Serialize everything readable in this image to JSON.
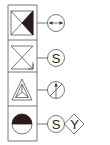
{
  "diagram": {
    "type": "symbol-legend",
    "colors": {
      "line": "#555555",
      "fill_dark": "#2a1a1a",
      "background": "#ffffff"
    },
    "rows": [
      {
        "index": 0,
        "left_symbol": "hourglass-box-right-triangle-filled",
        "connector": "horizontal-line",
        "right_symbols": [
          {
            "shape": "circle",
            "glyph": "double-arrow-horizontal",
            "label": ""
          }
        ]
      },
      {
        "index": 1,
        "left_symbol": "hourglass-box-with-arrow",
        "connector": "horizontal-line",
        "right_symbols": [
          {
            "shape": "circle",
            "glyph": "letter",
            "label": "S"
          }
        ]
      },
      {
        "index": 2,
        "left_symbol": "triangle-with-inner-y",
        "connector": "horizontal-line",
        "right_symbols": [
          {
            "shape": "circle",
            "glyph": "slash-with-up-arrow",
            "label": ""
          }
        ]
      },
      {
        "index": 3,
        "left_symbol": "circle-top-half-filled",
        "connector": "horizontal-line",
        "right_symbols": [
          {
            "shape": "circle",
            "glyph": "letter",
            "label": "S"
          },
          {
            "shape": "diamond",
            "glyph": "letter",
            "label": "Y"
          }
        ]
      }
    ]
  }
}
